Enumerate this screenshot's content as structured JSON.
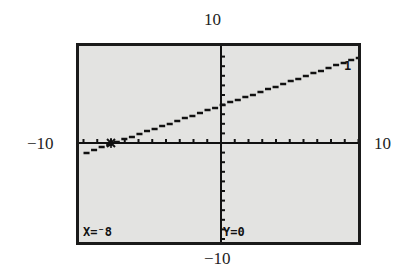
{
  "chart_data": {
    "type": "line",
    "title": "",
    "xlabel": "",
    "ylabel": "",
    "xlim": [
      -10,
      10
    ],
    "ylim": [
      -10,
      10
    ],
    "xscale": 1,
    "yscale": 1,
    "grid": false,
    "series": [
      {
        "name": "1",
        "equation": "y = 0.5x + 4",
        "x": [
          -10,
          -8,
          0,
          10
        ],
        "y": [
          -1,
          0,
          4,
          9
        ]
      }
    ],
    "trace_cursor": {
      "x": -8,
      "y": 0
    }
  },
  "window_labels": {
    "ymax": "10",
    "ymin": "−10",
    "xmin": "−10",
    "xmax": "10"
  },
  "screen": {
    "graph_label": "1",
    "x_readout": "X=⁻8",
    "y_readout": "Y=0",
    "background_color": "#e3e3e1",
    "ink_color": "#111111"
  }
}
